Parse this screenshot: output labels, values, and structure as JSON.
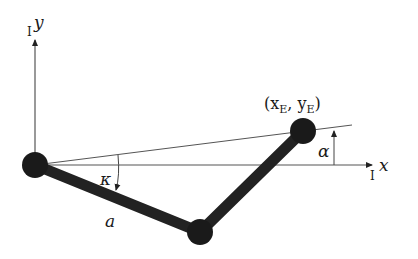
{
  "diagram": {
    "type": "two-link planar manipulator",
    "axes": {
      "y_label": "y",
      "y_prefix": "I",
      "x_label": "x",
      "x_prefix": "I"
    },
    "labels": {
      "end_effector": "(x",
      "end_effector_sub_x": "E",
      "end_effector_comma": ", y",
      "end_effector_sub_y": "E",
      "end_effector_close": ")",
      "alpha": "α",
      "kappa": "κ",
      "link_a": "a"
    },
    "colors": {
      "link": "#222222",
      "axis": "#444444",
      "background": "#ffffff"
    }
  }
}
